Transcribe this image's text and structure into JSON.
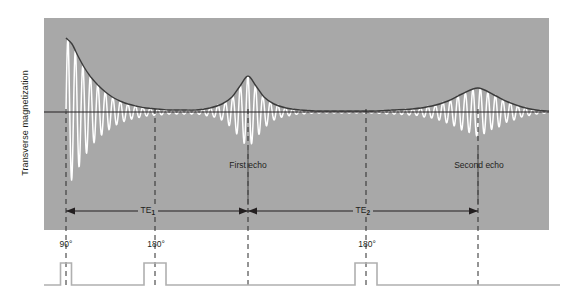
{
  "figure": {
    "y_axis_label": "Transverse magnetization",
    "panel_color": "#a8a8a8",
    "signal_color": "#ffffff",
    "envelope_color": "#3b3b3b",
    "axis_color": "#231f20",
    "pulse_color": "#b0b0b0",
    "background": "#ffffff"
  },
  "annotations": {
    "first_echo": "First echo",
    "second_echo": "Second echo",
    "te1": "TE",
    "te1_sub": "1",
    "te2": "TE",
    "te2_sub": "2",
    "pulse_90": "90°",
    "pulse_180_first": "180°",
    "pulse_180_second": "180°"
  },
  "chart_data": {
    "type": "line",
    "title": "",
    "xlabel": "",
    "ylabel": "Transverse magnetization",
    "grid": false,
    "legend": "none",
    "baseline_y_px": 112,
    "panel_px": {
      "left": 44,
      "top": 18,
      "width": 505,
      "height": 212
    },
    "event_markers": [
      {
        "name": "90° excitation pulse",
        "x_px": 66,
        "label": "90°",
        "dashed": true
      },
      {
        "name": "first 180° refocusing pulse",
        "x_px": 155,
        "label": "180°",
        "dashed": true
      },
      {
        "name": "first echo peak",
        "x_px": 248,
        "label": "First echo",
        "dashed": true
      },
      {
        "name": "second 180° refocusing pulse",
        "x_px": 366,
        "label": "180°",
        "dashed": true
      },
      {
        "name": "second echo peak",
        "x_px": 478,
        "label": "Second echo",
        "dashed": true
      }
    ],
    "intervals": [
      {
        "name": "TE1",
        "from_px": 66,
        "to_px": 248,
        "label": "TE1",
        "y_px": 211
      },
      {
        "name": "TE2",
        "from_px": 248,
        "to_px": 478,
        "label": "TE2",
        "y_px": 211
      }
    ],
    "series": [
      {
        "name": "T2 decay envelope",
        "description": "Exponential T2 decay with refocused echo peaks at each echo time",
        "points_px": [
          [
            66,
            38
          ],
          [
            72,
            44
          ],
          [
            78,
            56
          ],
          [
            84,
            67
          ],
          [
            90,
            76
          ],
          [
            96,
            83
          ],
          [
            102,
            89
          ],
          [
            108,
            94
          ],
          [
            114,
            98
          ],
          [
            120,
            101
          ],
          [
            128,
            104
          ],
          [
            136,
            106
          ],
          [
            146,
            108
          ],
          [
            158,
            109
          ],
          [
            170,
            110
          ],
          [
            182,
            110
          ],
          [
            196,
            110
          ],
          [
            210,
            108
          ],
          [
            222,
            104
          ],
          [
            232,
            97
          ],
          [
            240,
            86
          ],
          [
            248,
            76
          ],
          [
            256,
            86
          ],
          [
            264,
            97
          ],
          [
            274,
            104
          ],
          [
            286,
            108
          ],
          [
            300,
            110
          ],
          [
            316,
            111
          ],
          [
            334,
            111
          ],
          [
            352,
            111
          ],
          [
            372,
            111
          ],
          [
            392,
            110
          ],
          [
            412,
            109
          ],
          [
            432,
            106
          ],
          [
            448,
            101
          ],
          [
            462,
            94
          ],
          [
            478,
            88
          ],
          [
            494,
            95
          ],
          [
            508,
            102
          ],
          [
            522,
            107
          ],
          [
            536,
            110
          ],
          [
            549,
            111
          ]
        ]
      },
      {
        "name": "FID oscillating signal",
        "description": "Free induction decay: rapid oscillation modulated by the T2* envelope, dephasing after the 90° pulse and rephasing into each echo",
        "oscillation_period_px": 7.5
      }
    ],
    "pulse_sequence": {
      "name": "RF pulse train",
      "baseline_y_px": 285,
      "pulses": [
        {
          "label": "90°",
          "center_px": 66,
          "width_px": 11,
          "height_px": 22
        },
        {
          "label": "180°",
          "center_px": 155,
          "width_px": 22,
          "height_px": 22
        },
        {
          "label": "180°",
          "center_px": 366,
          "width_px": 22,
          "height_px": 22
        }
      ]
    }
  }
}
